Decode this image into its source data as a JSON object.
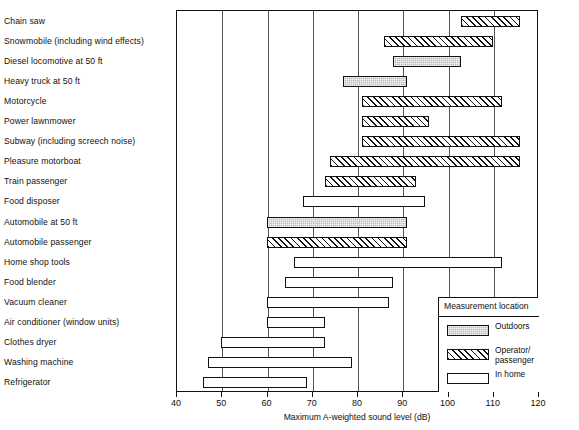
{
  "chart_data": {
    "type": "bar",
    "orientation": "horizontal-range",
    "title": "",
    "xlabel": "Maximum A-weighted sound level (dB)",
    "ylabel": "",
    "xlim": [
      40,
      120
    ],
    "xticks": [
      40,
      50,
      60,
      70,
      80,
      90,
      100,
      110,
      120
    ],
    "grid": "vertical",
    "legend_position": "bottom-right",
    "legend_title": "Measurement location",
    "series": [
      {
        "name": "Outdoors",
        "key": "outdoors",
        "pattern": "stipple-gray",
        "color": "#b9b9b9"
      },
      {
        "name": "Operator/\npassenger",
        "key": "operator",
        "pattern": "diagonal-hatch",
        "color": "#ffffff"
      },
      {
        "name": "In home",
        "key": "inhome",
        "pattern": "empty",
        "color": "#ffffff"
      }
    ],
    "categories": [
      "Chain saw",
      "Snowmobile (including wind effects)",
      "Diesel locomotive at 50 ft",
      "Heavy truck at 50 ft",
      "Motorcycle",
      "Power lawnmower",
      "Subway (including screech noise)",
      "Pleasure motorboat",
      "Train passenger",
      "Food disposer",
      "Automobile at 50 ft",
      "Automobile passenger",
      "Home shop tools",
      "Food blender",
      "Vacuum cleaner",
      "Air conditioner (window units)",
      "Clothes dryer",
      "Washing machine",
      "Refrigerator"
    ],
    "bars": [
      {
        "category": "Chain saw",
        "min": 103,
        "max": 116,
        "series": "operator"
      },
      {
        "category": "Snowmobile (including wind effects)",
        "min": 86,
        "max": 110,
        "series": "operator"
      },
      {
        "category": "Diesel locomotive at 50 ft",
        "min": 88,
        "max": 103,
        "series": "outdoors"
      },
      {
        "category": "Heavy truck at 50 ft",
        "min": 77,
        "max": 91,
        "series": "outdoors"
      },
      {
        "category": "Motorcycle",
        "min": 81,
        "max": 112,
        "series": "operator"
      },
      {
        "category": "Power lawnmower",
        "min": 81,
        "max": 96,
        "series": "operator"
      },
      {
        "category": "Subway (including screech noise)",
        "min": 81,
        "max": 116,
        "series": "operator"
      },
      {
        "category": "Pleasure motorboat",
        "min": 74,
        "max": 116,
        "series": "operator"
      },
      {
        "category": "Train passenger",
        "min": 73,
        "max": 93,
        "series": "operator"
      },
      {
        "category": "Food disposer",
        "min": 68,
        "max": 95,
        "series": "inhome"
      },
      {
        "category": "Automobile at 50 ft",
        "min": 60,
        "max": 91,
        "series": "outdoors"
      },
      {
        "category": "Automobile passenger",
        "min": 60,
        "max": 91,
        "series": "operator"
      },
      {
        "category": "Home shop tools",
        "min": 66,
        "max": 112,
        "series": "inhome"
      },
      {
        "category": "Food blender",
        "min": 64,
        "max": 88,
        "series": "inhome"
      },
      {
        "category": "Vacuum cleaner",
        "min": 60,
        "max": 87,
        "series": "inhome"
      },
      {
        "category": "Air conditioner (window units)",
        "min": 60,
        "max": 73,
        "series": "inhome"
      },
      {
        "category": "Clothes dryer",
        "min": 50,
        "max": 73,
        "series": "inhome"
      },
      {
        "category": "Washing machine",
        "min": 47,
        "max": 79,
        "series": "inhome"
      },
      {
        "category": "Refrigerator",
        "min": 46,
        "max": 69,
        "series": "inhome"
      }
    ]
  }
}
